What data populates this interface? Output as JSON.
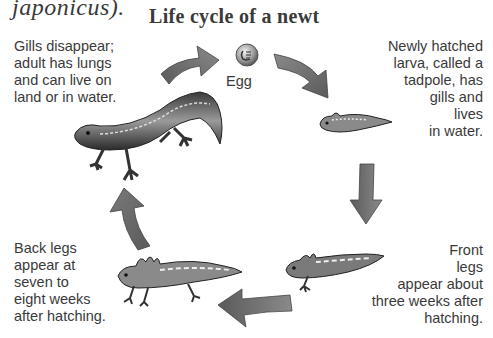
{
  "header": {
    "partial_text": "japonicus).",
    "title": "Life cycle of a newt"
  },
  "stages": {
    "egg": {
      "label": "Egg",
      "icon": "egg-icon"
    },
    "tadpole": {
      "label": "Newly hatched\nlarva, called a\ntadpole, has\ngills and\nlives\nin water.",
      "icon": "tadpole-illustration"
    },
    "front_legs": {
      "label": "Front\nlegs\nappear about\nthree weeks after\nhatching.",
      "icon": "larva-front-legs-illustration"
    },
    "back_legs": {
      "label": "Back legs\nappear at\nseven to\neight weeks\nafter hatching.",
      "icon": "larva-back-legs-illustration"
    },
    "adult": {
      "label": "Gills disappear;\nadult has lungs\nand can live on\nland or in water.",
      "icon": "adult-newt-illustration"
    }
  },
  "arrows": [
    {
      "from": "adult",
      "to": "egg",
      "direction": "right"
    },
    {
      "from": "egg",
      "to": "tadpole",
      "direction": "down-right"
    },
    {
      "from": "tadpole",
      "to": "front_legs",
      "direction": "down"
    },
    {
      "from": "front_legs",
      "to": "back_legs",
      "direction": "left"
    },
    {
      "from": "back_legs",
      "to": "adult",
      "direction": "up"
    }
  ],
  "colors": {
    "arrow_fill": "#6e6e6e",
    "arrow_light": "#9a9a9a",
    "text": "#3a3a3a"
  }
}
